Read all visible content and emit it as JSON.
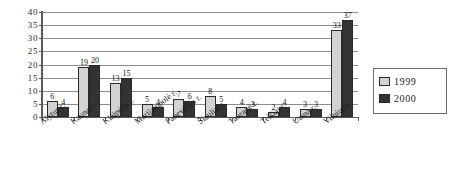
{
  "chart_data": {
    "type": "bar",
    "title": "",
    "subtitle": "",
    "xlabel": "",
    "ylabel": "",
    "ylim": [
      0,
      40
    ],
    "ytick_step": 5,
    "yticks": [
      "40",
      "35",
      "30",
      "25",
      "20",
      "15",
      "10",
      "5",
      "0"
    ],
    "grid": true,
    "legend_position": "right",
    "categories": [
      "Alytus r.",
      "Kaunas r.",
      "Klaipėda r.",
      "Marijampolė r.",
      "Panevėžys r.",
      "Šiauliai r.",
      "Tauragė r.",
      "Telšiai r.",
      "Utena r.",
      "Vilnius r."
    ],
    "series": [
      {
        "name": "1999",
        "color": "#d2d2d2",
        "values": [
          6,
          19,
          13,
          5,
          7,
          8,
          4,
          2,
          3,
          33
        ]
      },
      {
        "name": "2000",
        "color": "#333333",
        "values": [
          4,
          20,
          15,
          4,
          6,
          5,
          3,
          4,
          3,
          37
        ]
      }
    ]
  },
  "legend": {
    "items": [
      {
        "label": "1999",
        "swatch": "s1999"
      },
      {
        "label": "2000",
        "swatch": "s2000"
      }
    ]
  }
}
